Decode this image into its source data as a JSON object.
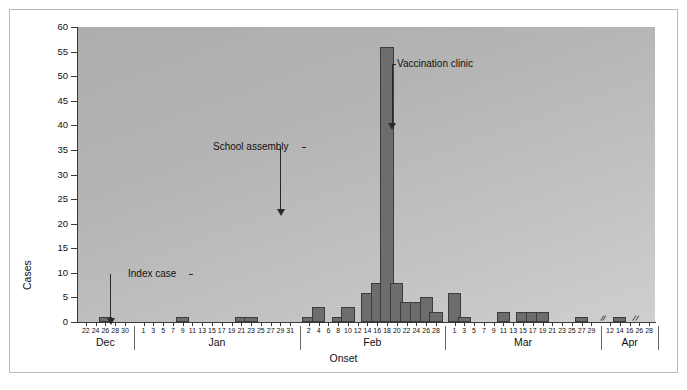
{
  "figure": {
    "title": "",
    "background": "#ffffff",
    "plot_background_light": "#cfcfcf",
    "plot_background_dark": "#adadad",
    "bar_color": "#6d6d6d",
    "bar_border_color": "#3c3c3c",
    "axis_color": "#3a3a3a"
  },
  "chart_data": {
    "type": "bar",
    "title": "",
    "subtitle": "",
    "xlabel": "Onset",
    "ylabel": "Cases",
    "ylim": [
      0,
      60
    ],
    "ytick_step": 5,
    "ytick_labels": [
      "0",
      "5",
      "10",
      "15",
      "20",
      "25",
      "30",
      "35",
      "40",
      "45",
      "50",
      "55",
      "60"
    ],
    "grid": false,
    "legend": null,
    "legend_position": "none",
    "bar_width_days": 2,
    "months": [
      {
        "name": "Dec",
        "tick_labels": [
          "22",
          "24",
          "26",
          "28",
          "30"
        ],
        "tick_days": [
          22,
          24,
          26,
          28,
          30
        ],
        "has_break": false
      },
      {
        "name": "Jan",
        "tick_labels": [
          "1",
          "3",
          "5",
          "7",
          "9",
          "11",
          "13",
          "15",
          "17",
          "19",
          "21",
          "23",
          "25",
          "27",
          "29",
          "31"
        ],
        "tick_days": [
          1,
          3,
          5,
          7,
          9,
          11,
          13,
          15,
          17,
          19,
          21,
          23,
          25,
          27,
          29,
          31
        ],
        "has_break": false
      },
      {
        "name": "Feb",
        "tick_labels": [
          "2",
          "4",
          "6",
          "8",
          "10",
          "12",
          "14",
          "16",
          "18",
          "20",
          "22",
          "24",
          "26",
          "28"
        ],
        "tick_days": [
          2,
          4,
          6,
          8,
          10,
          12,
          14,
          16,
          18,
          20,
          22,
          24,
          26,
          28
        ],
        "has_break": false
      },
      {
        "name": "Mar",
        "tick_labels": [
          "1",
          "3",
          "5",
          "7",
          "9",
          "11",
          "13",
          "15",
          "17",
          "19",
          "21",
          "23",
          "25",
          "27",
          "29"
        ],
        "tick_days": [
          1,
          3,
          5,
          7,
          9,
          11,
          13,
          15,
          17,
          19,
          21,
          23,
          25,
          27,
          29
        ],
        "has_break": false
      },
      {
        "name": "Apr",
        "tick_labels": [
          "12",
          "14",
          "16",
          "26",
          "28"
        ],
        "tick_days": [
          12,
          14,
          16,
          26,
          28
        ],
        "has_break": true,
        "break_marks": 2
      }
    ],
    "categories": [
      "Dec 26",
      "Jan 9",
      "Jan 21",
      "Jan 23",
      "Feb 2",
      "Feb 4",
      "Feb 8",
      "Feb 10",
      "Feb 14",
      "Feb 16",
      "Feb 18",
      "Feb 20",
      "Feb 22",
      "Feb 24",
      "Feb 26",
      "Feb 28",
      "Mar 1",
      "Mar 3",
      "Mar 11",
      "Mar 15",
      "Mar 17",
      "Mar 19",
      "Mar 27",
      "Apr 14"
    ],
    "values": [
      1,
      1,
      1,
      1,
      1,
      3,
      1,
      3,
      6,
      8,
      56,
      8,
      4,
      4,
      5,
      2,
      6,
      1,
      2,
      2,
      2,
      2,
      1,
      1
    ],
    "peak": {
      "label": "Feb 18",
      "value": 56
    },
    "bars": [
      {
        "month": "Dec",
        "day": 26,
        "value": 1
      },
      {
        "month": "Jan",
        "day": 9,
        "value": 1
      },
      {
        "month": "Jan",
        "day": 21,
        "value": 1
      },
      {
        "month": "Jan",
        "day": 23,
        "value": 1
      },
      {
        "month": "Feb",
        "day": 2,
        "value": 1
      },
      {
        "month": "Feb",
        "day": 4,
        "value": 3
      },
      {
        "month": "Feb",
        "day": 8,
        "value": 1
      },
      {
        "month": "Feb",
        "day": 10,
        "value": 3
      },
      {
        "month": "Feb",
        "day": 14,
        "value": 6
      },
      {
        "month": "Feb",
        "day": 16,
        "value": 8
      },
      {
        "month": "Feb",
        "day": 18,
        "value": 56
      },
      {
        "month": "Feb",
        "day": 20,
        "value": 8
      },
      {
        "month": "Feb",
        "day": 22,
        "value": 4
      },
      {
        "month": "Feb",
        "day": 24,
        "value": 4
      },
      {
        "month": "Feb",
        "day": 26,
        "value": 5
      },
      {
        "month": "Feb",
        "day": 28,
        "value": 2
      },
      {
        "month": "Mar",
        "day": 1,
        "value": 6
      },
      {
        "month": "Mar",
        "day": 3,
        "value": 1
      },
      {
        "month": "Mar",
        "day": 11,
        "value": 2
      },
      {
        "month": "Mar",
        "day": 15,
        "value": 2
      },
      {
        "month": "Mar",
        "day": 17,
        "value": 2
      },
      {
        "month": "Mar",
        "day": 19,
        "value": 2
      },
      {
        "month": "Mar",
        "day": 27,
        "value": 1
      },
      {
        "month": "Apr",
        "day": 14,
        "value": 1
      }
    ],
    "annotations": [
      {
        "id": "index-case",
        "text": "Index case",
        "points_to": "Dec 27",
        "value_at_point": 1
      },
      {
        "id": "school-assembly",
        "text": "School assembly",
        "points_to": "Jan 29",
        "value_at_point": 0
      },
      {
        "id": "vaccination-clinic",
        "text": "Vaccination clinic",
        "points_to": "Feb 19",
        "value_at_point": 56
      }
    ]
  }
}
